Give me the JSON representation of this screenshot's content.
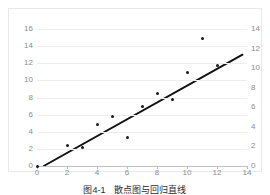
{
  "caption": "图4-1　散点图与回归直线",
  "colors": {
    "point": "#1a1a1a",
    "trendline": "#111111",
    "gridline": "#ededed",
    "axis": "#bfbfbf",
    "tick_text": "#8c8c8c",
    "frame_border": "#e8e8e8",
    "background": "#ffffff"
  },
  "chart_data": {
    "type": "scatter",
    "title": "",
    "subtitle": "",
    "xlabel": "",
    "ylabel": "",
    "grid": true,
    "legend": "none",
    "xlim": [
      0,
      14
    ],
    "xticks": [
      0,
      2,
      4,
      6,
      8,
      10,
      12,
      14
    ],
    "xticklabels": [
      "0",
      "2",
      "4",
      "6",
      "8",
      "10",
      "12",
      "14"
    ],
    "ylim": [
      0,
      16
    ],
    "yticks": [
      0,
      2,
      4,
      6,
      8,
      10,
      12,
      14,
      16
    ],
    "yticklabels": [
      "0",
      "2",
      "4",
      "6",
      "8",
      "10",
      "12",
      "14",
      "16"
    ],
    "y2lim": [
      0,
      14
    ],
    "y2ticks": [
      0,
      2,
      4,
      6,
      8,
      10,
      12,
      14
    ],
    "y2ticklabels": [
      "0",
      "2",
      "4",
      "6",
      "8",
      "10",
      "12",
      "14"
    ],
    "series": [
      {
        "name": "observations",
        "type": "scatter",
        "marker": "circle",
        "x": [
          0,
          2,
          3,
          4,
          5,
          6,
          7,
          8,
          9,
          10,
          11,
          12
        ],
        "y": [
          0.0,
          2.35,
          2.2,
          4.9,
          5.8,
          3.35,
          6.95,
          8.45,
          7.8,
          10.9,
          14.9,
          11.7
        ]
      },
      {
        "name": "trend-line",
        "type": "line",
        "x": [
          0.45,
          13.7
        ],
        "y": [
          0.0,
          13.0
        ]
      }
    ]
  }
}
